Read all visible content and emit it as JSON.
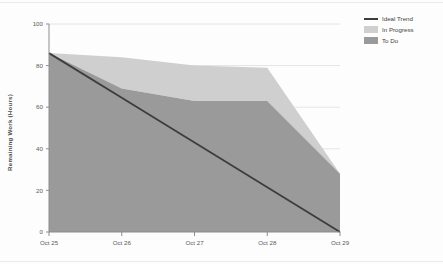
{
  "chart_data": {
    "type": "area",
    "title": "",
    "xlabel": "",
    "ylabel": "Remaining Work (Hours)",
    "categories": [
      "Oct 25",
      "Oct 26",
      "Oct 27",
      "Oct 28",
      "Oct 29"
    ],
    "ylim": [
      0,
      100
    ],
    "yticks": [
      0,
      20,
      40,
      60,
      80,
      100
    ],
    "ytick_labels": [
      "0",
      "20",
      "40",
      "60",
      "80",
      "100"
    ],
    "grid": true,
    "stacked": true,
    "legend_position": "top-right",
    "series": [
      {
        "name": "Ideal Trend",
        "type": "line",
        "color": "#3d3d3d",
        "values": [
          86,
          64.5,
          43,
          21.5,
          0
        ]
      },
      {
        "name": "In Progress",
        "type": "area",
        "color": "#cfcfcf",
        "values": [
          0,
          15,
          17,
          16,
          0
        ]
      },
      {
        "name": "To Do",
        "type": "area",
        "color": "#9a9a9a",
        "values": [
          86,
          69,
          63,
          63,
          28
        ]
      }
    ],
    "stack_totals": [
      86,
      84,
      80,
      79,
      28
    ]
  },
  "legend": {
    "items": [
      {
        "label": "Ideal Trend",
        "color": "#3d3d3d",
        "shape": "line"
      },
      {
        "label": "In Progress",
        "color": "#cfcfcf",
        "shape": "box"
      },
      {
        "label": "To Do",
        "color": "#9a9a9a",
        "shape": "box"
      }
    ]
  },
  "axes": {
    "y_title": "Remaining Work (Hours)",
    "y_ticks": [
      "100",
      "80",
      "60",
      "40",
      "20",
      "0"
    ],
    "x_ticks": [
      "Oct 25",
      "Oct 26",
      "Oct 27",
      "Oct 28",
      "Oct 29"
    ]
  },
  "colors": {
    "todo": "#9a9a9a",
    "in_progress": "#cfcfcf",
    "ideal": "#3d3d3d",
    "axis": "#888888",
    "grid": "#e4e4e4",
    "background": "#fdfdfd"
  }
}
